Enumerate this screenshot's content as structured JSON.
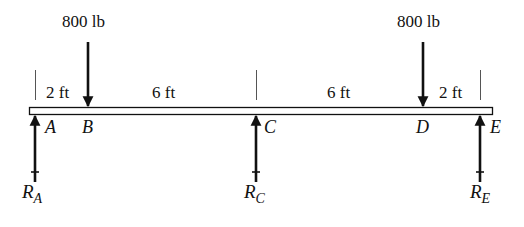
{
  "diagram": {
    "type": "simply-supported-beam",
    "beam": {
      "label": "beam",
      "x_start": 29,
      "x_end": 492,
      "y_top": 107,
      "y_bottom": 114
    },
    "loads": [
      {
        "id": "load-b",
        "label": "800 lb",
        "point": "B",
        "x": 88
      },
      {
        "id": "load-d",
        "label": "800 lb",
        "point": "D",
        "x": 423
      }
    ],
    "points": [
      {
        "name": "A",
        "x": 35
      },
      {
        "name": "B",
        "x": 88
      },
      {
        "name": "C",
        "x": 256
      },
      {
        "name": "D",
        "x": 423
      },
      {
        "name": "E",
        "x": 480
      }
    ],
    "dimensions": [
      {
        "from": "A",
        "to": "B",
        "label": "2 ft"
      },
      {
        "from": "B",
        "to": "C",
        "label": "6 ft"
      },
      {
        "from": "C",
        "to": "D",
        "label": "6 ft"
      },
      {
        "from": "D",
        "to": "E",
        "label": "2 ft"
      }
    ],
    "reactions": [
      {
        "id": "reaction-a",
        "symbol": "R",
        "subscript": "A",
        "point": "A",
        "x": 35
      },
      {
        "id": "reaction-c",
        "symbol": "R",
        "subscript": "C",
        "point": "C",
        "x": 256
      },
      {
        "id": "reaction-e",
        "symbol": "R",
        "subscript": "E",
        "point": "E",
        "x": 480
      }
    ],
    "colors": {
      "ink": "#111111",
      "beam_fill": "#ffffff",
      "tick": "#555555"
    }
  }
}
